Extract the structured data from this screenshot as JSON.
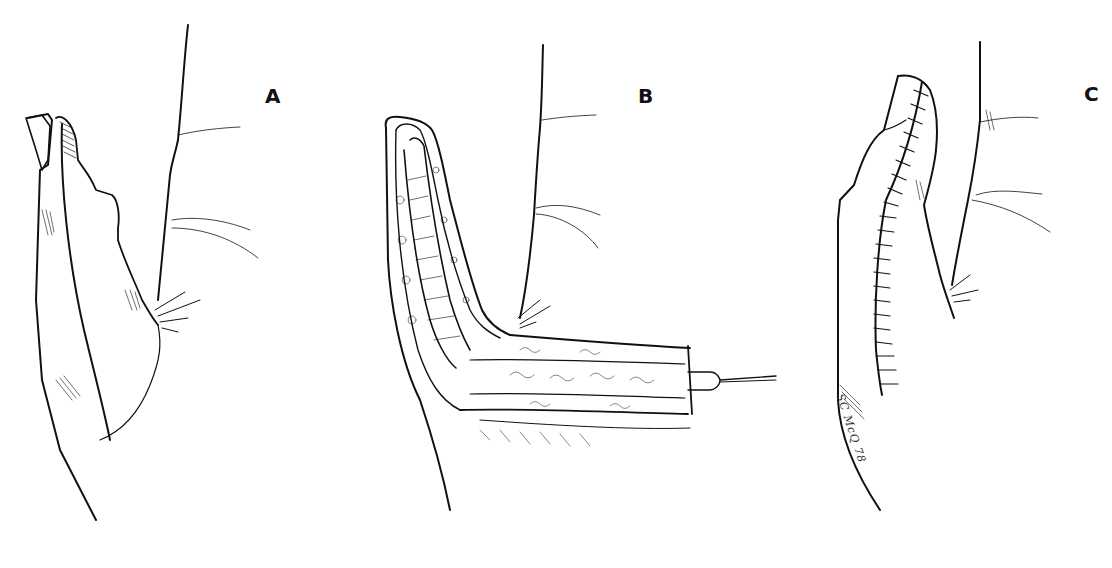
{
  "figure": {
    "panels": [
      {
        "label": "A",
        "content": "Injured thumb tip with defect, adjacent palm"
      },
      {
        "label": "B",
        "content": "Opened flap elevated and retracted with a skin hook"
      },
      {
        "label": "C",
        "content": "Flap sutured in place with interrupted sutures"
      }
    ],
    "signature": "SC McQ 78"
  },
  "colors": {
    "ink": "#111111",
    "background": "#ffffff"
  }
}
